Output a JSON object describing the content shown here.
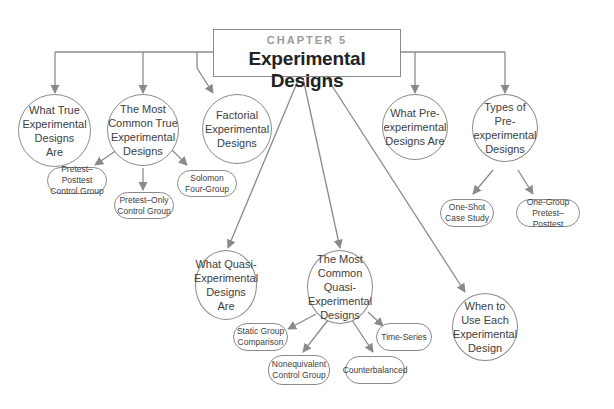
{
  "header": {
    "chapter": "CHAPTER 5",
    "title": "Experimental Designs"
  },
  "colors": {
    "line": "#8a8a8a",
    "text": "#404040",
    "chapter_text": "#9a9a9a"
  },
  "nodes": {
    "what_true": "What True\nExperimental\nDesigns\nAre",
    "most_common_true": "The Most\nCommon True\nExperimental\nDesigns",
    "factorial": "Factorial\nExperimental\nDesigns",
    "what_pre": "What Pre-\nexperimental\nDesigns Are",
    "types_pre": "Types of Pre-\nexperimental\nDesigns",
    "what_quasi": "What Quasi-\nExperimental\nDesigns\nAre",
    "most_common_quasi": "The Most\nCommon\nQuasi-\nExperimental\nDesigns",
    "when_to_use": "When to\nUse Each\nExperimental\nDesign"
  },
  "leaves": {
    "pretest_posttest": "Pretest–Posttest\nControl Group",
    "pretest_only": "Pretest–Only\nControl Group",
    "solomon": "Solomon\nFour-Group",
    "one_shot": "One-Shot\nCase Study",
    "one_group": "One-Group\nPretest–Posttest",
    "static_group": "Static Group\nComparison",
    "nonequivalent": "Nonequivalent\nControl Group",
    "counterbalanced": "Counterbalanced",
    "time_series": "Time-Series"
  }
}
